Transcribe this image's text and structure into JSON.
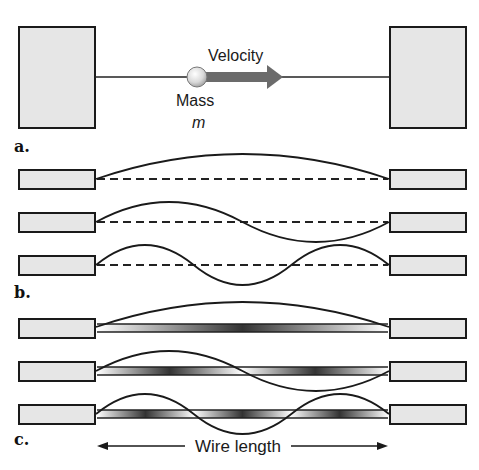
{
  "diagram": {
    "panels": [
      {
        "id": "a",
        "label": "a.",
        "velocity_label": "Velocity",
        "mass_label": "Mass",
        "mass_symbol": "m",
        "description": "Mass on wire moving with velocity between two fixed blocks"
      },
      {
        "id": "b",
        "label": "b.",
        "modes": [
          {
            "harmonic": 1,
            "half_wavelengths": 1
          },
          {
            "harmonic": 2,
            "half_wavelengths": 2
          },
          {
            "harmonic": 3,
            "half_wavelengths": 3
          }
        ],
        "description": "Standing wave modes with dashed equilibrium line"
      },
      {
        "id": "c",
        "label": "c.",
        "modes": [
          {
            "harmonic": 1,
            "half_wavelengths": 1
          },
          {
            "harmonic": 2,
            "half_wavelengths": 2
          },
          {
            "harmonic": 3,
            "half_wavelengths": 3
          }
        ],
        "wire_length_label": "Wire length",
        "description": "Standing wave modes shown on a shaded tube"
      }
    ],
    "colors": {
      "block_fill": "#e6e6e6",
      "outline": "#1a1a1a",
      "arrow": "#6b6b6b",
      "mass_ball": "#d8d8d8"
    }
  }
}
